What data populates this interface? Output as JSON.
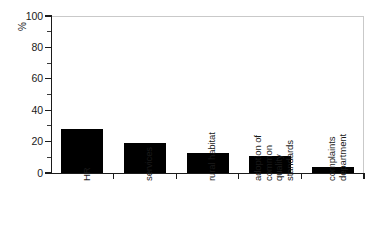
{
  "chart_data": {
    "type": "bar",
    "title": "",
    "subtitle": "",
    "xlabel": "",
    "ylabel": "%",
    "ylim": [
      0,
      100
    ],
    "ytick_values": [
      0,
      20,
      40,
      60,
      80,
      100
    ],
    "ytick_labels": [
      "0",
      "20",
      "40",
      "60",
      "80",
      "100"
    ],
    "yminor_values": [
      10,
      30,
      50,
      70,
      90
    ],
    "grid": false,
    "legend": null,
    "bar_color": "#000000",
    "categories": [
      "HR",
      "services",
      "rural habitat",
      "adoption of common quality standards",
      "complaints department"
    ],
    "category_label_lines": [
      [
        "HR"
      ],
      [
        "services"
      ],
      [
        "rural habitat"
      ],
      [
        "adoption of",
        "common",
        "quality",
        "standards"
      ],
      [
        "complaints",
        "department"
      ]
    ],
    "values": [
      28,
      19,
      13,
      11,
      4
    ]
  },
  "colors": {
    "bar": "#000000",
    "axis": "#1b1b1b",
    "frame": "#c9c9c9",
    "text": "#1a1a1a",
    "background": "#ffffff"
  }
}
